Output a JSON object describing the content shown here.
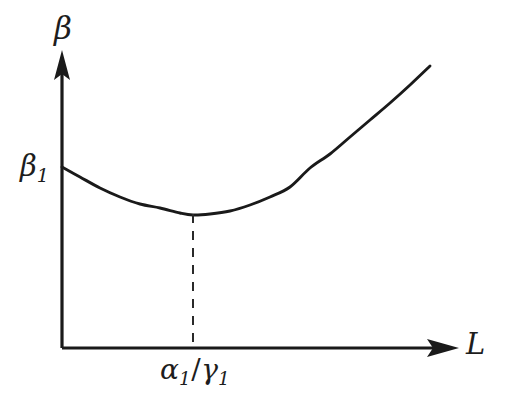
{
  "figure": {
    "background_color": "#ffffff",
    "ink_color": "#1a1a1a",
    "width": 505,
    "height": 405
  },
  "labels": {
    "y_axis": {
      "symbol": "β",
      "subscript": ""
    },
    "x_axis": {
      "symbol": "L",
      "subscript": ""
    },
    "y_intercept": {
      "symbol": "β",
      "subscript": "1"
    },
    "minimum_tick": {
      "numerator_symbol": "α",
      "numerator_subscript": "1",
      "separator": "/",
      "denominator_symbol": "γ",
      "denominator_subscript": "1"
    }
  },
  "chart_data": {
    "type": "line",
    "title": "",
    "xlabel": "L",
    "ylabel": "β",
    "grid": false,
    "legend": false,
    "axis_style": "arrowed-half-axes",
    "x": [
      62,
      80,
      100,
      120,
      140,
      160,
      180,
      193,
      210,
      230,
      250,
      270,
      290,
      310,
      330,
      350,
      370,
      390,
      410,
      430
    ],
    "y": [
      167,
      177,
      188,
      197,
      204,
      208,
      213,
      215,
      214,
      211,
      205,
      197,
      187,
      168,
      154,
      137,
      120,
      103,
      85,
      66
    ],
    "series": [
      {
        "name": "beta-curve",
        "description": "convex curve decreasing from beta_1 to a minimum then increasing",
        "values": [
          167,
          177,
          188,
          197,
          204,
          208,
          213,
          215,
          214,
          211,
          205,
          197,
          187,
          168,
          154,
          137,
          120,
          103,
          85,
          66
        ]
      }
    ],
    "annotations": [
      {
        "name": "y-intercept-label",
        "text": "β₁",
        "at_x": 62,
        "at_y": 167
      },
      {
        "name": "minimum-dropline",
        "text": "α₁/γ₁",
        "at_x": 193,
        "at_y": 215,
        "style": "dashed vertical from minimum to x-axis"
      }
    ],
    "axes": {
      "origin_x": 62,
      "origin_y": 348,
      "x_axis_end": 458,
      "y_axis_end": 52,
      "xlim": [
        62,
        458
      ],
      "ylim": [
        348,
        52
      ],
      "x_ticks": [
        "α₁/γ₁"
      ],
      "y_ticks": [
        "β₁"
      ]
    }
  }
}
